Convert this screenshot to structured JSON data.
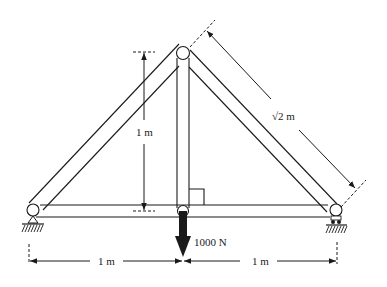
{
  "diagram": {
    "type": "truss",
    "labels": {
      "height": "1 m",
      "diagonal": "√2 m",
      "load": "1000 N",
      "left_span": "1 m",
      "right_span": "1 m"
    },
    "joints": [
      "left-support-joint",
      "apex-joint",
      "bottom-center-joint",
      "right-support-joint"
    ],
    "members": [
      "left-diagonal",
      "right-diagonal",
      "vertical-center",
      "bottom-chord-left",
      "bottom-chord-right"
    ],
    "supports": {
      "left": "pin-support",
      "right": "roller-support"
    }
  }
}
